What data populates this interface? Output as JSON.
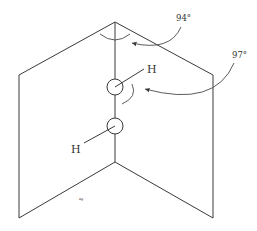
{
  "diagram": {
    "type": "molecular-geometry",
    "atoms": [
      {
        "label": "H",
        "position": "upper"
      },
      {
        "label": "H",
        "position": "lower"
      }
    ],
    "angles": [
      {
        "label": "94°",
        "meaning": "dihedral angle between planes"
      },
      {
        "label": "97°",
        "meaning": "O–O–H bond angle"
      }
    ],
    "stray_mark": "ag",
    "colors": {
      "stroke": "#3a3a3a",
      "background": "#ffffff"
    }
  }
}
